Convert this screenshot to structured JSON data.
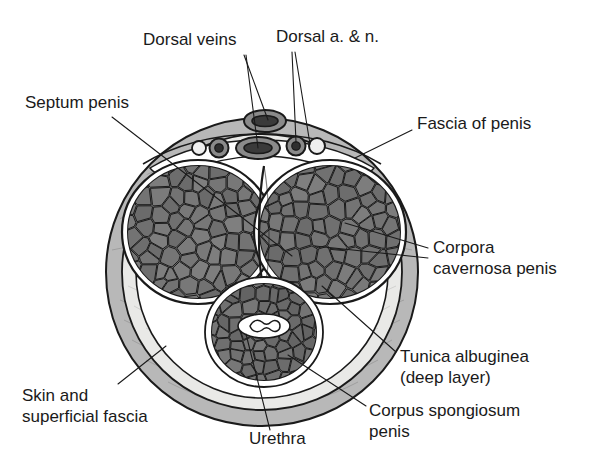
{
  "figure": {
    "background_color": "#ffffff",
    "ink_color": "#1a1a1a"
  },
  "palette": {
    "skin_fascia_gray": "#b8b8b8",
    "deep_fascia_pale": "#e8e8e6",
    "inner_white": "#ffffff",
    "cavernous_tissue": "#6e6e6e",
    "cavernous_cell": "#757575",
    "spongiosum_tissue": "#6e6e6e",
    "vessel_dark": "#3a3a3a",
    "vessel_mid": "#8a8a8a",
    "outline": "#1a1a1a"
  },
  "labels": [
    {
      "id": "dorsal-veins",
      "lines": [
        "Dorsal veins"
      ],
      "x": 143,
      "y": 41,
      "anchor": "start",
      "leaders": [
        [
          [
            244,
            55
          ],
          [
            268,
            120
          ]
        ],
        [
          [
            246,
            55
          ],
          [
            258,
            148
          ]
        ]
      ]
    },
    {
      "id": "dorsal-a-n",
      "lines": [
        "Dorsal a. & n."
      ],
      "x": 276,
      "y": 38,
      "anchor": "start",
      "leaders": [
        [
          [
            292,
            52
          ],
          [
            296,
            142
          ]
        ],
        [
          [
            295,
            52
          ],
          [
            310,
            144
          ]
        ]
      ]
    },
    {
      "id": "septum-penis",
      "lines": [
        "Septum penis"
      ],
      "x": 25,
      "y": 104,
      "anchor": "start",
      "leaders": [
        [
          [
            112,
            117
          ],
          [
            292,
            256
          ]
        ]
      ]
    },
    {
      "id": "fascia-of-penis",
      "lines": [
        "Fascia of penis"
      ],
      "x": 417,
      "y": 125,
      "anchor": "start",
      "leaders": [
        [
          [
            412,
            130
          ],
          [
            355,
            158
          ]
        ]
      ]
    },
    {
      "id": "corpora-cavernosa-penis",
      "lines": [
        "Corpora",
        "cavernosa penis"
      ],
      "x": 433,
      "y": 249,
      "anchor": "start",
      "leaders": [
        [
          [
            428,
            248
          ],
          [
            345,
            223
          ]
        ],
        [
          [
            428,
            258
          ],
          [
            315,
            246
          ]
        ]
      ]
    },
    {
      "id": "tunica-albuginea",
      "lines": [
        "Tunica albuginea",
        "(deep layer)"
      ],
      "x": 400,
      "y": 358,
      "anchor": "start",
      "leaders": [
        [
          [
            396,
            352
          ],
          [
            322,
            286
          ]
        ]
      ]
    },
    {
      "id": "corpus-spongiosum-penis",
      "lines": [
        "Corpus spongiosum",
        "penis"
      ],
      "x": 369,
      "y": 412,
      "anchor": "start",
      "leaders": [
        [
          [
            366,
            406
          ],
          [
            288,
            355
          ]
        ]
      ]
    },
    {
      "id": "skin-and-superficial-fascia",
      "lines": [
        "Skin and",
        "superficial fascia"
      ],
      "x": 22,
      "y": 397,
      "anchor": "start",
      "leaders": [
        [
          [
            118,
            384
          ],
          [
            166,
            346
          ]
        ]
      ]
    },
    {
      "id": "urethra",
      "lines": [
        "Urethra"
      ],
      "x": 249,
      "y": 440,
      "anchor": "start",
      "leaders": [
        [
          [
            270,
            430
          ],
          [
            246,
            334
          ]
        ]
      ]
    }
  ],
  "structures": [
    {
      "id": "skin-superficial-fascia",
      "name": "Skin and superficial fascia"
    },
    {
      "id": "fascia-of-penis",
      "name": "Fascia of penis"
    },
    {
      "id": "tunica-albuginea-deep",
      "name": "Tunica albuginea (deep layer)"
    },
    {
      "id": "corpus-cavernosum-left",
      "name": "Left corpus cavernosum penis"
    },
    {
      "id": "corpus-cavernosum-right",
      "name": "Right corpus cavernosum penis"
    },
    {
      "id": "septum-penis",
      "name": "Septum penis"
    },
    {
      "id": "corpus-spongiosum",
      "name": "Corpus spongiosum penis"
    },
    {
      "id": "urethra-lumen",
      "name": "Urethra"
    },
    {
      "id": "superficial-dorsal-vein",
      "name": "Superficial dorsal vein"
    },
    {
      "id": "deep-dorsal-vein",
      "name": "Deep dorsal vein"
    },
    {
      "id": "dorsal-artery-left",
      "name": "Left dorsal artery"
    },
    {
      "id": "dorsal-artery-right",
      "name": "Right dorsal artery"
    },
    {
      "id": "dorsal-nerve-left",
      "name": "Left dorsal nerve"
    },
    {
      "id": "dorsal-nerve-right",
      "name": "Right dorsal nerve"
    }
  ],
  "geometry": {
    "outer_body": {
      "cx": 262,
      "cy": 272,
      "rx": 152,
      "ry": 150
    },
    "cavernosum_left": {
      "cx": 198,
      "cy": 232,
      "rx": 70,
      "ry": 66
    },
    "cavernosum_right": {
      "cx": 330,
      "cy": 232,
      "rx": 70,
      "ry": 66
    },
    "spongiosum": {
      "cx": 264,
      "cy": 332,
      "rx": 52,
      "ry": 48
    },
    "urethra": {
      "cx": 264,
      "cy": 326,
      "rx": 25,
      "ry": 11
    },
    "vessels": [
      {
        "id": "superficial-dorsal-vein",
        "type": "vein",
        "cx": 265,
        "cy": 121,
        "rx": 20,
        "ry": 10
      },
      {
        "id": "deep-dorsal-vein",
        "type": "vein",
        "cx": 258,
        "cy": 148,
        "rx": 21,
        "ry": 10
      },
      {
        "id": "dorsal-artery-right",
        "type": "artery",
        "cx": 296,
        "cy": 146,
        "r": 9
      },
      {
        "id": "dorsal-nerve-right",
        "type": "nerve",
        "cx": 317,
        "cy": 146,
        "r": 8
      },
      {
        "id": "dorsal-artery-left",
        "type": "artery",
        "cx": 219,
        "cy": 148,
        "r": 9
      },
      {
        "id": "dorsal-nerve-left",
        "type": "nerve",
        "cx": 199,
        "cy": 148,
        "r": 7
      }
    ]
  }
}
